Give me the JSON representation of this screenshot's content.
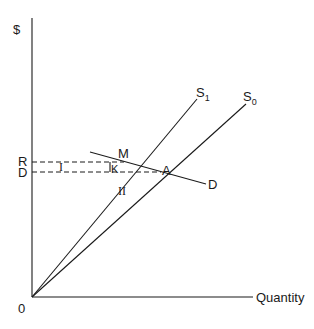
{
  "diagram": {
    "y_axis_label": "$",
    "x_axis_label": "Quantity",
    "origin_label": "0",
    "price_labels": {
      "upper": "R",
      "lower": "D"
    },
    "curves": {
      "s1": {
        "label": "S",
        "subscript": "1"
      },
      "s0": {
        "label": "S",
        "subscript": "0"
      },
      "demand": {
        "label": "D"
      }
    },
    "points": {
      "m": "M",
      "k": "K",
      "a": "A"
    },
    "regions": {
      "one": "I",
      "two": "II"
    }
  }
}
